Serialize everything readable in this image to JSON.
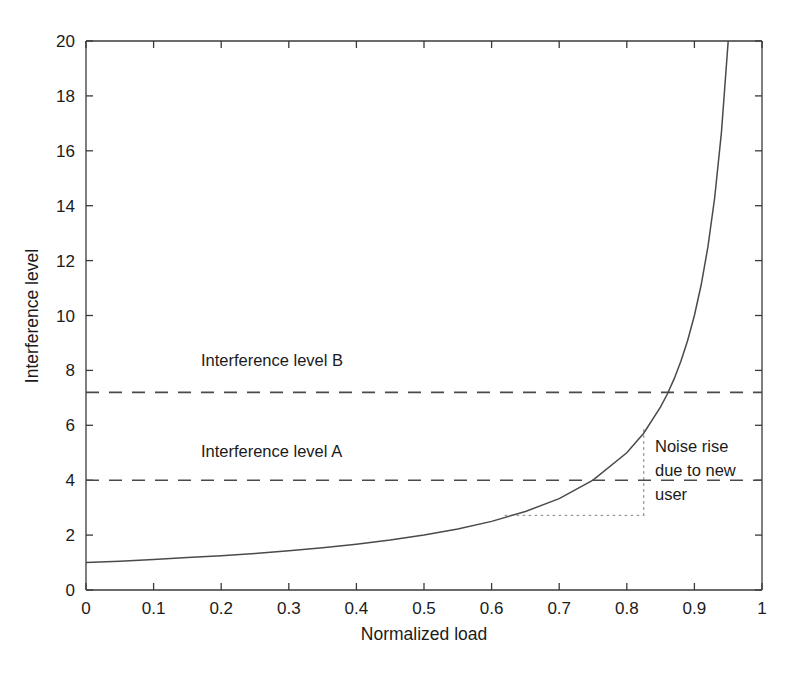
{
  "chart_data": {
    "type": "line",
    "title": "",
    "xlabel": "Normalized load",
    "ylabel": "Interference level",
    "xlim": [
      0,
      1
    ],
    "ylim": [
      0,
      20
    ],
    "grid": false,
    "legend": "none",
    "xticks": [
      "0",
      "0.1",
      "0.2",
      "0.3",
      "0.4",
      "0.5",
      "0.6",
      "0.7",
      "0.8",
      "0.9",
      "1"
    ],
    "xtick_values": [
      0,
      0.1,
      0.2,
      0.3,
      0.4,
      0.5,
      0.6,
      0.7,
      0.8,
      0.9,
      1
    ],
    "yticks": [
      "0",
      "2",
      "4",
      "6",
      "8",
      "10",
      "12",
      "14",
      "16",
      "18",
      "20"
    ],
    "ytick_values": [
      0,
      2,
      4,
      6,
      8,
      10,
      12,
      14,
      16,
      18,
      20
    ],
    "series": [
      {
        "name": "Interference level vs normalized load",
        "style": "solid",
        "formula": "y = 1 / (1 - x)",
        "x": [
          0.0,
          0.05,
          0.1,
          0.15,
          0.2,
          0.25,
          0.3,
          0.35,
          0.4,
          0.45,
          0.5,
          0.55,
          0.6,
          0.65,
          0.7,
          0.75,
          0.8,
          0.825,
          0.85,
          0.86,
          0.87,
          0.88,
          0.89,
          0.9,
          0.91,
          0.92,
          0.93,
          0.94,
          0.95
        ],
        "values": [
          1.0,
          1.05,
          1.11,
          1.18,
          1.25,
          1.33,
          1.43,
          1.54,
          1.67,
          1.82,
          2.0,
          2.22,
          2.5,
          2.86,
          3.33,
          4.0,
          5.0,
          5.71,
          6.67,
          7.14,
          7.69,
          8.33,
          9.09,
          10.0,
          11.11,
          12.5,
          14.29,
          16.67,
          20.0
        ]
      }
    ],
    "reference_lines": [
      {
        "name": "interference-level-b",
        "label": "Interference level B",
        "value": 7.2,
        "style": "dashed",
        "label_x": 0.17,
        "label_y": 8.15
      },
      {
        "name": "interference-level-a",
        "label": "Interference level A",
        "value": 4.0,
        "style": "dashed",
        "label_x": 0.17,
        "label_y": 4.85
      }
    ],
    "annotations": [
      {
        "name": "noise-rise-annotation",
        "lines": [
          "Noise rise",
          "due to new",
          "user"
        ],
        "text": "Noise rise due to new user",
        "x": 0.845,
        "y": 5.6
      }
    ],
    "guides": [
      {
        "name": "vertical-guide",
        "orientation": "vertical",
        "x": 0.825,
        "y_from": 2.72,
        "y_to": 5.85,
        "style": "dotted"
      },
      {
        "name": "horizontal-guide",
        "orientation": "horizontal",
        "y": 2.72,
        "x_from": 0.62,
        "x_to": 0.825,
        "style": "dotted"
      }
    ],
    "colors": {
      "axis": "#3a3a3a",
      "curve": "#4a4a4a",
      "reference_line": "#4a4a4a",
      "guide": "#9a9a9a",
      "text": "#1b1b1b",
      "background": "#ffffff"
    }
  }
}
